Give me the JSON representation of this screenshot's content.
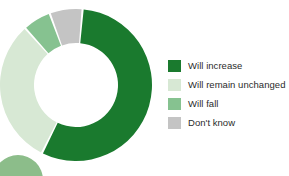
{
  "chart_data": {
    "type": "pie",
    "variant": "donut",
    "title": "",
    "subtitle": "",
    "xlabel": "",
    "ylabel": "",
    "legend_position": "right",
    "grid": false,
    "start_angle_deg": 5,
    "direction": "clockwise",
    "center": {
      "x": 76,
      "y": 85
    },
    "outer_radius": 76,
    "inner_radius": 42,
    "categories": [
      "Will increase",
      "Will remain unchanged",
      "Will fall",
      "Don't know"
    ],
    "values": [
      56,
      31,
      6,
      7
    ],
    "colors": [
      "#1a7a2e",
      "#d7e8d4",
      "#86c290",
      "#c4c4c4"
    ],
    "slices": [
      {
        "label": "Will increase",
        "value": 56,
        "color": "#1a7a2e",
        "start_deg": 5,
        "end_deg": 206
      },
      {
        "label": "Will remain unchanged",
        "value": 31,
        "color": "#d7e8d4",
        "start_deg": 206,
        "end_deg": 318
      },
      {
        "label": "Will fall",
        "value": 6,
        "color": "#86c290",
        "start_deg": 318,
        "end_deg": 339
      },
      {
        "label": "Don't know",
        "value": 7,
        "color": "#c4c4c4",
        "start_deg": 339,
        "end_deg": 365
      }
    ]
  },
  "legend": {
    "items": [
      {
        "label": "Will increase",
        "color": "#1a7a2e"
      },
      {
        "label": "Will remain unchanged",
        "color": "#d7e8d4"
      },
      {
        "label": "Will fall",
        "color": "#86c290"
      },
      {
        "label": "Don't know",
        "color": "#c4c4c4"
      }
    ]
  },
  "decoration": {
    "corner_circle": {
      "color": "#8cbd8a",
      "center_x": 18,
      "center_y": 180,
      "radius": 25
    }
  },
  "colors": {
    "background": "#ffffff",
    "text": "#2b2b2b",
    "gap": "#ffffff"
  }
}
